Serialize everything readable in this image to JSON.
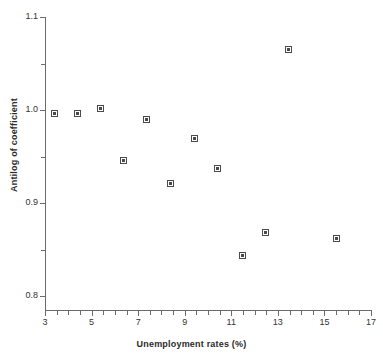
{
  "chart_data": {
    "type": "scatter",
    "title": "",
    "xlabel": "Unemployment rates (%)",
    "ylabel": "Antilog of coefficient",
    "xlim": [
      3,
      17
    ],
    "ylim": [
      0.8,
      1.1
    ],
    "grid": false,
    "legend": null,
    "x_ticks": [
      {
        "value": 3,
        "label": "3",
        "major": true
      },
      {
        "value": 3.5,
        "label": "",
        "major": false
      },
      {
        "value": 4,
        "label": "",
        "major": false
      },
      {
        "value": 4.5,
        "label": "",
        "major": false
      },
      {
        "value": 5,
        "label": "5",
        "major": true
      },
      {
        "value": 5.5,
        "label": "",
        "major": false
      },
      {
        "value": 6,
        "label": "",
        "major": false
      },
      {
        "value": 6.5,
        "label": "",
        "major": false
      },
      {
        "value": 7,
        "label": "7",
        "major": true
      },
      {
        "value": 7.5,
        "label": "",
        "major": false
      },
      {
        "value": 8,
        "label": "",
        "major": false
      },
      {
        "value": 8.5,
        "label": "",
        "major": false
      },
      {
        "value": 9,
        "label": "9",
        "major": true
      },
      {
        "value": 9.5,
        "label": "",
        "major": false
      },
      {
        "value": 10,
        "label": "",
        "major": false
      },
      {
        "value": 10.5,
        "label": "",
        "major": false
      },
      {
        "value": 11,
        "label": "11",
        "major": true
      },
      {
        "value": 11.5,
        "label": "",
        "major": false
      },
      {
        "value": 12,
        "label": "",
        "major": false
      },
      {
        "value": 12.5,
        "label": "",
        "major": false
      },
      {
        "value": 13,
        "label": "13",
        "major": true
      },
      {
        "value": 13.5,
        "label": "",
        "major": false
      },
      {
        "value": 14,
        "label": "",
        "major": false
      },
      {
        "value": 14.5,
        "label": "",
        "major": false
      },
      {
        "value": 15,
        "label": "15",
        "major": true
      },
      {
        "value": 15.5,
        "label": "",
        "major": false
      },
      {
        "value": 16,
        "label": "",
        "major": false
      },
      {
        "value": 16.5,
        "label": "",
        "major": false
      },
      {
        "value": 17,
        "label": "17",
        "major": true
      }
    ],
    "y_ticks": [
      {
        "value": 0.8,
        "label": "0.8",
        "major": true
      },
      {
        "value": 0.85,
        "label": "",
        "major": false
      },
      {
        "value": 0.9,
        "label": "0.9",
        "major": true
      },
      {
        "value": 0.95,
        "label": "",
        "major": false
      },
      {
        "value": 1.0,
        "label": "1.0",
        "major": true
      },
      {
        "value": 1.05,
        "label": "",
        "major": false
      },
      {
        "value": 1.1,
        "label": "1.1",
        "major": true
      }
    ],
    "points": [
      {
        "x": 3.4,
        "y": 0.996
      },
      {
        "x": 4.4,
        "y": 0.996
      },
      {
        "x": 5.4,
        "y": 1.002
      },
      {
        "x": 6.35,
        "y": 0.946
      },
      {
        "x": 7.35,
        "y": 0.99
      },
      {
        "x": 8.4,
        "y": 0.921
      },
      {
        "x": 9.4,
        "y": 0.969
      },
      {
        "x": 10.4,
        "y": 0.937
      },
      {
        "x": 11.5,
        "y": 0.844
      },
      {
        "x": 12.45,
        "y": 0.868
      },
      {
        "x": 13.45,
        "y": 1.065
      },
      {
        "x": 15.5,
        "y": 0.862
      }
    ],
    "marker_color": "#4a4a4a",
    "axis_color": "#6b6b6b"
  }
}
